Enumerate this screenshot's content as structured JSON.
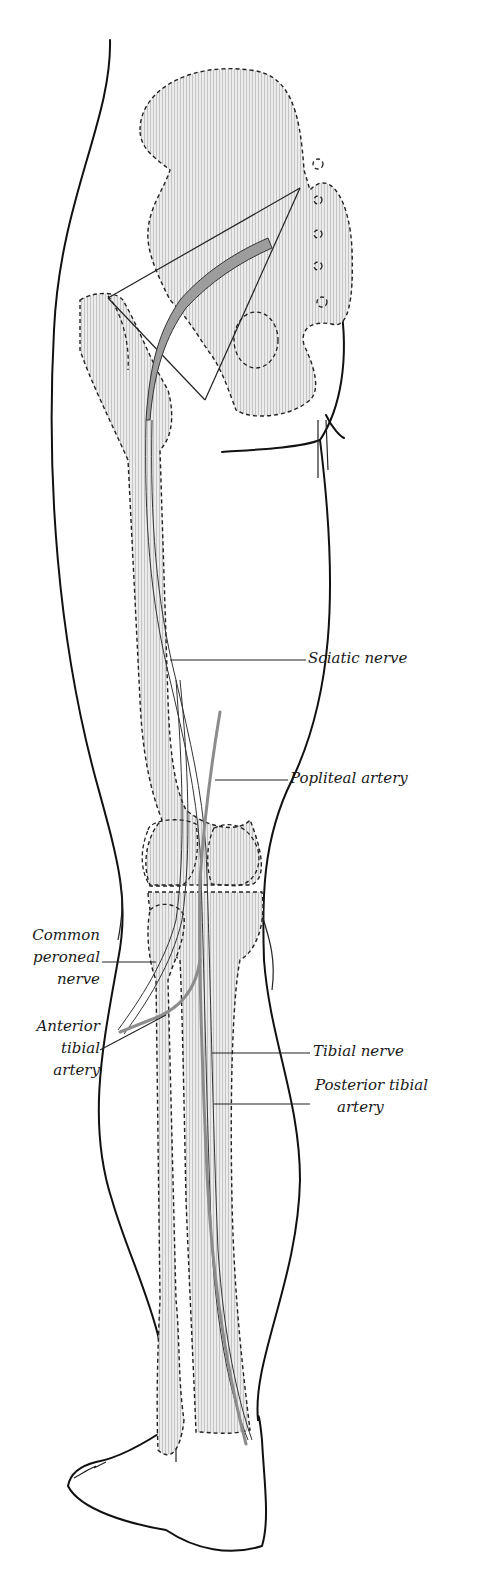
{
  "figure": {
    "labels": {
      "sciatic_nerve": "Sciatic nerve",
      "popliteal_artery": "Popliteal artery",
      "common_peroneal_line1": "Common",
      "common_peroneal_line2": "peroneal",
      "common_peroneal_line3": "nerve",
      "anterior_tibial_line1": "Anterior",
      "anterior_tibial_line2": "tibial",
      "anterior_tibial_line3": "artery",
      "tibial_nerve": "Tibial nerve",
      "posterior_tibial_line1": "Posterior tibial",
      "posterior_tibial_line2": "artery"
    },
    "colors": {
      "line": "#111111",
      "bone_hatch": "#cfcfcf",
      "nerve": "#9a9a9a",
      "background": "#ffffff"
    }
  }
}
